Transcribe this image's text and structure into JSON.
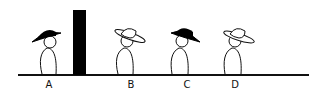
{
  "figure": {
    "ground_color": "#111111",
    "wall_color": "#000000",
    "figures": [
      {
        "label": "A",
        "hat": "black",
        "x": 49,
        "facing": "right"
      },
      {
        "label": "B",
        "hat": "white",
        "x": 129,
        "facing": "left"
      },
      {
        "label": "C",
        "hat": "black",
        "x": 184,
        "facing": "left"
      },
      {
        "label": "D",
        "hat": "white",
        "x": 237,
        "facing": "left"
      }
    ]
  }
}
